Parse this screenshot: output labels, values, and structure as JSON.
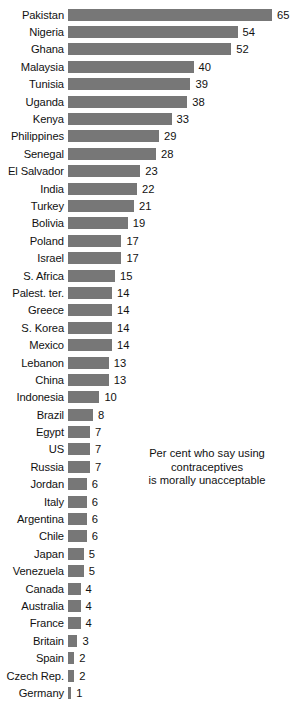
{
  "chart_data": {
    "type": "bar",
    "orientation": "horizontal",
    "title": "",
    "xlabel": "",
    "ylabel": "",
    "xlim": [
      0,
      65
    ],
    "grid": false,
    "legend": null,
    "annotation": {
      "lines": [
        "Per cent who say using contraceptives",
        "is morally unacceptable"
      ],
      "text": "Per cent who say using contraceptives is morally unacceptable"
    },
    "value_suffix": "",
    "bar_color": "#777777",
    "categories": [
      "Pakistan",
      "Nigeria",
      "Ghana",
      "Malaysia",
      "Tunisia",
      "Uganda",
      "Kenya",
      "Philippines",
      "Senegal",
      "El Salvador",
      "India",
      "Turkey",
      "Bolivia",
      "Poland",
      "Israel",
      "S. Africa",
      "Palest. ter.",
      "Greece",
      "S. Korea",
      "Mexico",
      "Lebanon",
      "China",
      "Indonesia",
      "Brazil",
      "Egypt",
      "US",
      "Russia",
      "Jordan",
      "Italy",
      "Argentina",
      "Chile",
      "Japan",
      "Venezuela",
      "Canada",
      "Australia",
      "France",
      "Britain",
      "Spain",
      "Czech Rep.",
      "Germany"
    ],
    "values": [
      65,
      54,
      52,
      40,
      39,
      38,
      33,
      29,
      28,
      23,
      22,
      21,
      19,
      17,
      17,
      15,
      14,
      14,
      14,
      14,
      13,
      13,
      10,
      8,
      7,
      7,
      7,
      6,
      6,
      6,
      6,
      5,
      5,
      4,
      4,
      4,
      3,
      2,
      2,
      1
    ]
  }
}
